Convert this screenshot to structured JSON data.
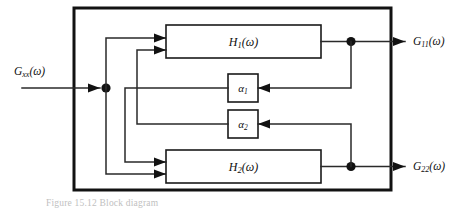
{
  "figure": {
    "type": "block-diagram",
    "caption": "Figure  15.12   Block diagram"
  },
  "inputs": [
    {
      "id": "input-gxx",
      "label_main": "G",
      "label_sub": "xx",
      "label_arg": "(ω)",
      "full": "G_xx(ω)"
    }
  ],
  "outputs": [
    {
      "id": "output-g11",
      "label_main": "G",
      "label_sub": "11",
      "label_arg": "(ω)",
      "full": "G_11(ω)"
    },
    {
      "id": "output-g22",
      "label_main": "G",
      "label_sub": "22",
      "label_arg": "(ω)",
      "full": "G_22(ω)"
    }
  ],
  "blocks": [
    {
      "id": "block-h1",
      "label_main": "H",
      "label_sub": "1",
      "label_arg": "(ω)",
      "full": "H_1(ω)"
    },
    {
      "id": "block-h2",
      "label_main": "H",
      "label_sub": "2",
      "label_arg": "(ω)",
      "full": "H_2(ω)"
    }
  ],
  "gains": [
    {
      "id": "gain-alpha1",
      "label_main": "α",
      "label_sub": "1",
      "full": "α_1"
    },
    {
      "id": "gain-alpha2",
      "label_main": "α",
      "label_sub": "2",
      "full": "α_2"
    }
  ],
  "colors": {
    "frame": "#121212",
    "wire": "#2a2a2a",
    "block_stroke": "#1a1a1a",
    "background": "#ffffff",
    "text": "#101010",
    "caption": "#8c8c8c"
  }
}
